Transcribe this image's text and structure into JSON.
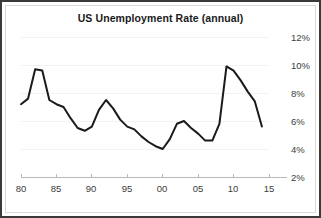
{
  "chart_data": {
    "type": "line",
    "title": "US Unemployment Rate (annual)",
    "xlabel": "",
    "ylabel": "",
    "grid": true,
    "legend": false,
    "y_axis_position": "right",
    "xlim": [
      1980,
      2015
    ],
    "ylim": [
      2,
      12
    ],
    "yticks": [
      2,
      4,
      6,
      8,
      10,
      12
    ],
    "ytick_labels": [
      "2%",
      "4%",
      "6%",
      "8%",
      "10%",
      "12%"
    ],
    "xticks": [
      1980,
      1985,
      1990,
      1995,
      2000,
      2005,
      2010,
      2015
    ],
    "xtick_labels": [
      "80",
      "85",
      "90",
      "95",
      "00",
      "05",
      "10",
      "15"
    ],
    "line_color": "#1a1a1a",
    "series": [
      {
        "name": "US Unemployment Rate",
        "x": [
          1980,
          1981,
          1982,
          1983,
          1984,
          1985,
          1986,
          1987,
          1988,
          1989,
          1990,
          1991,
          1992,
          1993,
          1994,
          1995,
          1996,
          1997,
          1998,
          1999,
          2000,
          2001,
          2002,
          2003,
          2004,
          2005,
          2006,
          2007,
          2008,
          2009,
          2010,
          2011,
          2012,
          2013,
          2014
        ],
        "values": [
          7.2,
          7.6,
          9.7,
          9.6,
          7.5,
          7.2,
          7.0,
          6.2,
          5.5,
          5.3,
          5.6,
          6.8,
          7.5,
          6.9,
          6.1,
          5.6,
          5.4,
          4.9,
          4.5,
          4.2,
          4.0,
          4.7,
          5.8,
          6.0,
          5.5,
          5.1,
          4.6,
          4.6,
          5.8,
          9.9,
          9.6,
          8.9,
          8.1,
          7.4,
          5.6
        ]
      }
    ]
  }
}
